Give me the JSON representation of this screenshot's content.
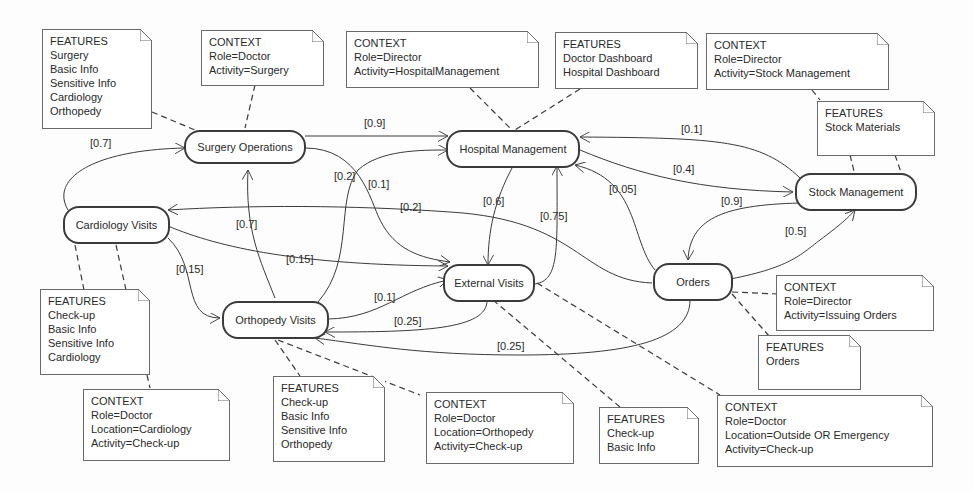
{
  "states": {
    "surgery": {
      "label": "Surgery Operations"
    },
    "hospital": {
      "label": "Hospital Management"
    },
    "stock": {
      "label": "Stock Management"
    },
    "cardiology": {
      "label": "Cardiology Visits"
    },
    "external": {
      "label": "External Visits"
    },
    "orders": {
      "label": "Orders"
    },
    "orthopedy": {
      "label": "Orthopedy Visits"
    }
  },
  "notes": {
    "surgery_features": [
      "FEATURES",
      "Surgery",
      "Basic Info",
      "Sensitive Info",
      "Cardiology",
      "Orthopedy"
    ],
    "surgery_context": [
      "CONTEXT",
      "Role=Doctor",
      "Activity=Surgery"
    ],
    "hospital_context": [
      "CONTEXT",
      "Role=Director",
      "Activity=HospitalManagement"
    ],
    "hospital_features": [
      "FEATURES",
      "Doctor Dashboard",
      "Hospital Dashboard"
    ],
    "stock_context": [
      "CONTEXT",
      "Role=Director",
      "Activity=Stock Management"
    ],
    "stock_features": [
      "FEATURES",
      "Stock Materials"
    ],
    "cardiology_features": [
      "FEATURES",
      "Check-up",
      "Basic Info",
      "Sensitive Info",
      "Cardiology"
    ],
    "cardiology_context": [
      "CONTEXT",
      "Role=Doctor",
      "Location=Cardiology",
      "Activity=Check-up"
    ],
    "orthopedy_features": [
      "FEATURES",
      "Check-up",
      "Basic Info",
      "Sensitive Info",
      "Orthopedy"
    ],
    "orthopedy_context": [
      "CONTEXT",
      "Role=Doctor",
      "Location=Orthopedy",
      "Activity=Check-up"
    ],
    "external_features": [
      "FEATURES",
      "Check-up",
      "Basic Info"
    ],
    "external_context": [
      "CONTEXT",
      "Role=Doctor",
      "Location=Outside OR Emergency",
      "Activity=Check-up"
    ],
    "orders_context": [
      "CONTEXT",
      "Role=Director",
      "Activity=Issuing Orders"
    ],
    "orders_features": [
      "FEATURES",
      "Orders"
    ]
  },
  "transitions": [
    {
      "from": "Cardiology Visits",
      "to": "Surgery Operations",
      "prob": "[0.7]"
    },
    {
      "from": "Surgery Operations",
      "to": "Hospital Management",
      "prob": "[0.9]"
    },
    {
      "from": "Surgery Operations",
      "to": "External Visits",
      "prob": "[0.1]"
    },
    {
      "from": "Orthopedy Visits",
      "to": "Hospital Management",
      "prob": "[0.2]"
    },
    {
      "from": "Orthopedy Visits",
      "to": "Surgery Operations",
      "prob": "[0.7]"
    },
    {
      "from": "Stock Management",
      "to": "Hospital Management",
      "prob": "[0.1]"
    },
    {
      "from": "Hospital Management",
      "to": "Stock Management",
      "prob": "[0.4]"
    },
    {
      "from": "Orders",
      "to": "Hospital Management",
      "prob": "[0.05]"
    },
    {
      "from": "Hospital Management",
      "to": "External Visits",
      "prob": "[0.6]"
    },
    {
      "from": "External Visits",
      "to": "Hospital Management",
      "prob": "[0.75]"
    },
    {
      "from": "Orders",
      "to": "Cardiology Visits",
      "prob": "[0.2]"
    },
    {
      "from": "Stock Management",
      "to": "Orders",
      "prob": "[0.9]"
    },
    {
      "from": "Orders",
      "to": "Stock Management",
      "prob": "[0.5]"
    },
    {
      "from": "Cardiology Visits",
      "to": "External Visits",
      "prob": "[0.15]"
    },
    {
      "from": "Cardiology Visits",
      "to": "Orthopedy Visits",
      "prob": "[0.15]"
    },
    {
      "from": "Orthopedy Visits",
      "to": "External Visits",
      "prob": "[0.1]"
    },
    {
      "from": "External Visits",
      "to": "Orthopedy Visits",
      "prob": "[0.25]"
    },
    {
      "from": "Orders",
      "to": "Orthopedy Visits",
      "prob": "[0.25]"
    }
  ],
  "labels": {
    "l07a": "[0.7]",
    "l09a": "[0.9]",
    "l01a": "[0.1]",
    "l04": "[0.4]",
    "l02a": "[0.2]",
    "l01b": "[0.1]",
    "l02b": "[0.2]",
    "l06": "[0.6]",
    "l075": "[0.75]",
    "l005": "[0.05]",
    "l09b": "[0.9]",
    "l05": "[0.5]",
    "l07b": "[0.7]",
    "l015a": "[0.15]",
    "l015b": "[0.15]",
    "l01c": "[0.1]",
    "l025a": "[0.25]",
    "l025b": "[0.25]"
  },
  "colors": {
    "line": "#3b3b3b",
    "note_border": "#6a6a6a",
    "text": "#2a2a2a"
  }
}
